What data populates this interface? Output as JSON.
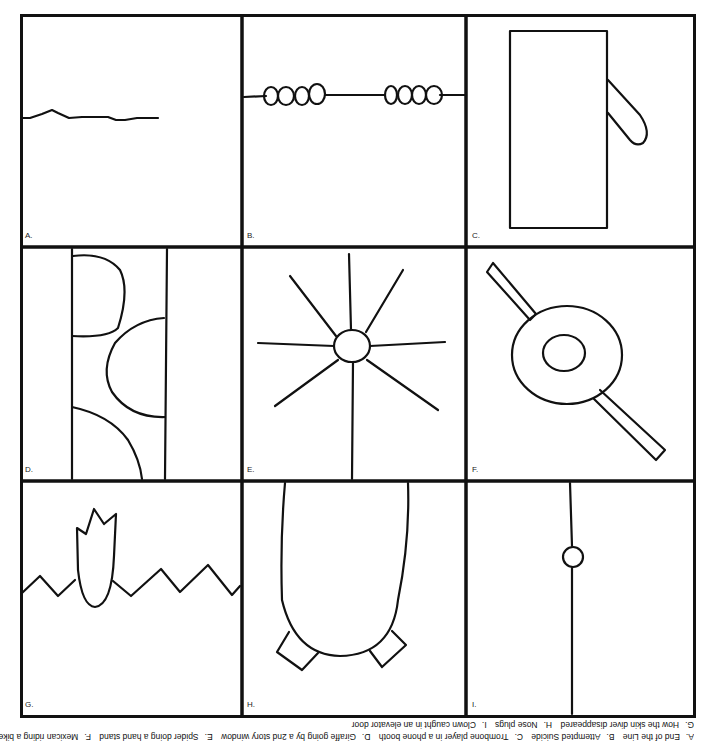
{
  "puzzle": {
    "type": "droodles",
    "panels": [
      {
        "letter": "A.",
        "answer": "End of the Line"
      },
      {
        "letter": "B.",
        "answer": "Attempted Suicide"
      },
      {
        "letter": "C.",
        "answer": "Trombone player in a phone booth"
      },
      {
        "letter": "D.",
        "answer": "Giraffe going by a 2nd story window"
      },
      {
        "letter": "E.",
        "answer": "Spider doing a hand stand"
      },
      {
        "letter": "F.",
        "answer": "Mexican riding a bike"
      },
      {
        "letter": "G.",
        "answer": "How the skin diver disappeared"
      },
      {
        "letter": "H.",
        "answer": "Nose plugs"
      },
      {
        "letter": "I.",
        "answer": "Clown caught in an elevator door"
      }
    ]
  },
  "caption": {
    "orientation": "upside-down",
    "line1": [
      "A.",
      "End of the Line",
      "B.",
      "Attempted Suicide",
      "C.",
      "Trombone player in a phone booth",
      "D.",
      "Giraffe going by a 2nd story window",
      "E.",
      "Spider doing a hand stand",
      "F.",
      "Mexican riding a bike"
    ],
    "line2": [
      "G.",
      "How the skin diver disappeared",
      "H.",
      "Nose plugs",
      "I.",
      "Clown caught in an elevator door"
    ]
  },
  "colors": {
    "ink": "#111111",
    "paper": "#ffffff"
  }
}
